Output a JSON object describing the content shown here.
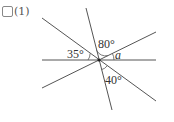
{
  "problem": {
    "number_label": "(1)"
  },
  "figure": {
    "center": [
      99,
      60
    ],
    "lines": [
      {
        "name": "steep-line",
        "x1": 86,
        "y1": 8,
        "x2": 112,
        "y2": 110
      },
      {
        "name": "descending-line",
        "x1": 42,
        "y1": 18,
        "x2": 156,
        "y2": 101
      },
      {
        "name": "horizontal-line",
        "x1": 42,
        "y1": 60,
        "x2": 156,
        "y2": 60
      },
      {
        "name": "ascending-line",
        "x1": 42,
        "y1": 88,
        "x2": 156,
        "y2": 32
      }
    ],
    "angle_labels": {
      "left": "35°",
      "top": "80°",
      "unknown": "a",
      "bottom": "40°"
    },
    "line_color": "#555555"
  }
}
